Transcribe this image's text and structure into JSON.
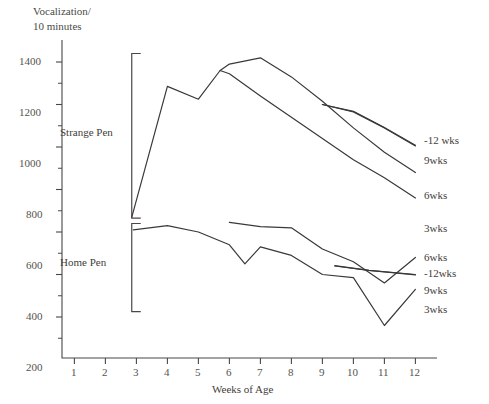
{
  "chart_data": {
    "type": "line",
    "title": "Vocalization/\n10 minutes",
    "title_line1": "Vocalization/",
    "title_line2": "10 minutes",
    "xlabel": "Weeks of Age",
    "ylabel": "Vocalization/10 minutes",
    "xlim": [
      0.4,
      12.6
    ],
    "ylim": [
      0,
      1500
    ],
    "yticks": [
      200,
      400,
      600,
      800,
      1000,
      1200,
      1400
    ],
    "ytick_labels": [
      "200",
      "400",
      "600",
      "800",
      "1000",
      "1200",
      "1400"
    ],
    "yminor_ticks": [
      100,
      300,
      500,
      700,
      900,
      1100,
      1300
    ],
    "xticks": [
      1,
      2,
      3,
      4,
      5,
      6,
      7,
      8,
      9,
      10,
      11,
      12
    ],
    "xtick_labels": [
      "1",
      "2",
      "3",
      "4",
      "5",
      "6",
      "7",
      "8",
      "9",
      "10",
      "11",
      "12"
    ],
    "grid": false,
    "legend_position": "right-inline",
    "groups": [
      {
        "name": "Strange Pen",
        "label": "Strange Pen"
      },
      {
        "name": "Home Pen",
        "label": "Home Pen"
      }
    ],
    "series": [
      {
        "name": "strange-3wks",
        "group": "Strange Pen",
        "label": "3wks",
        "label_x": 12.45,
        "label_y": 690,
        "x": [
          2.85,
          4,
          5,
          5.7,
          6,
          7,
          8,
          9,
          10,
          11,
          12
        ],
        "values": [
          670,
          1285,
          1225,
          1360,
          1345,
          1240,
          1140,
          1040,
          940,
          855,
          760
        ]
      },
      {
        "name": "strange-6wks",
        "group": "Strange Pen",
        "label": "6wks",
        "label_x": 12.45,
        "label_y": 880,
        "x": [
          5.7,
          6,
          7,
          8,
          9,
          10,
          11,
          12
        ],
        "values": [
          1360,
          1390,
          1420,
          1330,
          1215,
          1090,
          975,
          880
        ]
      },
      {
        "name": "strange-9wks",
        "group": "Strange Pen",
        "label": "9wks",
        "label_x": 12.45,
        "label_y": 1000,
        "x": [
          9,
          10,
          11,
          12
        ],
        "values": [
          1200,
          1165,
          1090,
          1005
        ]
      },
      {
        "name": "strange-12wks",
        "group": "Strange Pen",
        "label": "-12 wks",
        "label_x": 12.45,
        "label_y": 1095,
        "x": [
          9,
          10,
          11,
          12
        ],
        "values": [
          1200,
          1168,
          1092,
          1008
        ]
      },
      {
        "name": "home-3wks",
        "group": "Home Pen",
        "label": "3wks",
        "label_x": 12.45,
        "label_y": 330,
        "x": [
          2.9,
          4,
          5,
          6,
          6.5,
          7,
          8,
          9,
          10,
          11,
          12
        ],
        "values": [
          610,
          630,
          600,
          540,
          450,
          530,
          490,
          400,
          385,
          160,
          330
        ]
      },
      {
        "name": "home-6wks",
        "group": "Home Pen",
        "label": "6wks",
        "label_x": 12.45,
        "label_y": 480,
        "x": [
          6,
          7,
          8,
          9,
          10,
          11,
          12
        ],
        "values": [
          645,
          625,
          620,
          520,
          460,
          360,
          480
        ]
      },
      {
        "name": "home-12wks",
        "group": "Home Pen",
        "label": "-12wks",
        "label_x": 12.45,
        "label_y": 430,
        "x": [
          9.4,
          10.5,
          12
        ],
        "values": [
          440,
          420,
          400
        ]
      },
      {
        "name": "home-9wks",
        "group": "Home Pen",
        "label": "9wks",
        "label_x": 12.45,
        "label_y": 380,
        "x": [
          9.4,
          10.5,
          12
        ],
        "values": [
          442,
          420,
          398
        ]
      }
    ],
    "brackets": [
      {
        "name": "strange-pen-bracket",
        "y_top": 1440,
        "y_bottom": 665,
        "x": 2.85
      },
      {
        "name": "home-pen-bracket",
        "y_top": 640,
        "y_bottom": 225,
        "x": 2.85
      }
    ]
  }
}
